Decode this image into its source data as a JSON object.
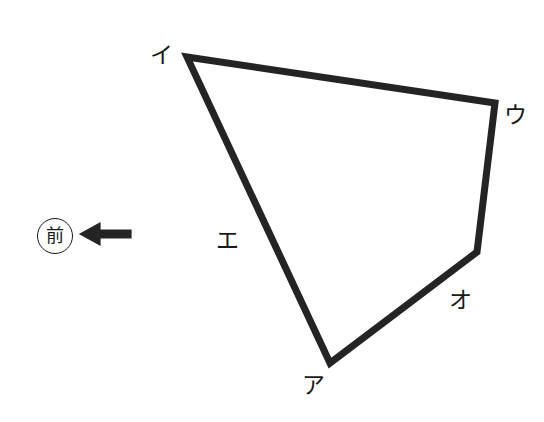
{
  "figure": {
    "canvas": {
      "width": 544,
      "height": 422,
      "background": "#ffffff"
    },
    "stroke_color": "#242424",
    "stroke_width": 7,
    "polygon": {
      "name": "land-plot-outline",
      "closed": true,
      "points": "187,57 495,103 477,252 330,363",
      "vertices": [
        {
          "label": "イ",
          "x": 187,
          "y": 57
        },
        {
          "label": "ウ",
          "x": 495,
          "y": 103
        },
        {
          "label": "オ",
          "x": 477,
          "y": 252
        },
        {
          "label": "ア",
          "x": 330,
          "y": 363
        }
      ]
    },
    "labels": [
      {
        "id": "label-i",
        "text": "イ",
        "x": 150,
        "y": 44
      },
      {
        "id": "label-u",
        "text": "ウ",
        "x": 504,
        "y": 104
      },
      {
        "id": "label-o",
        "text": "オ",
        "x": 449,
        "y": 289
      },
      {
        "id": "label-a",
        "text": "ア",
        "x": 302,
        "y": 374
      },
      {
        "id": "label-e",
        "text": "エ",
        "x": 216,
        "y": 229
      }
    ],
    "edge_labels": [
      {
        "id": "edge-e",
        "text": "エ",
        "edge_from": "イ",
        "edge_to": "ア"
      }
    ],
    "direction_marker": {
      "circle_text": "前",
      "circle_center_x": 55,
      "circle_center_y": 236,
      "circle_radius": 18,
      "arrow": {
        "name": "left-arrow",
        "direction": "left",
        "tip_x": 80,
        "tail_x": 131,
        "y": 234,
        "head_width": 20,
        "head_height": 22,
        "shaft_height": 8
      }
    }
  }
}
